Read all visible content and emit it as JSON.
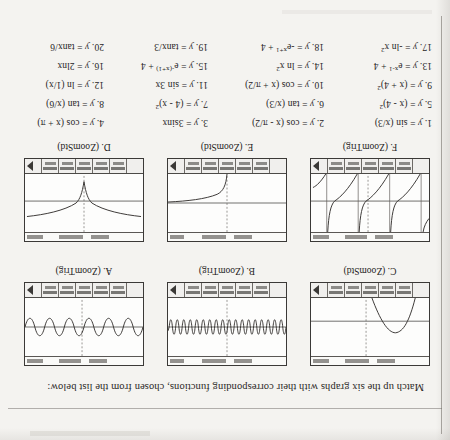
{
  "page": {
    "orientation": "upside-down",
    "title": "Match up the six graphs with their corresponding functions, chosen from the list below:"
  },
  "graphs": [
    {
      "id": "A",
      "label": "A. (ZoomTrig)",
      "window": "ZoomTrig",
      "shape": "sine-wave-moderate-frequency",
      "description": "Sine wave of moderate frequency, about 4 visible cycles, small amplitude, centered on the x-axis"
    },
    {
      "id": "B",
      "label": "B. (ZoomTrig)",
      "window": "ZoomTrig",
      "shape": "sine-wave-high-frequency",
      "description": "Sine wave of high frequency, about 18 visible cycles, small amplitude, centered on the x-axis"
    },
    {
      "id": "C",
      "label": "C. (ZoomStd)",
      "window": "ZoomStd",
      "shape": "downward-parabola",
      "description": "Downward-opening parabola with vertex above the x-axis in the left half of the screen"
    },
    {
      "id": "D",
      "label": "D. (ZoomStd)",
      "window": "ZoomStd",
      "shape": "negative-log-squared",
      "description": "Two symmetric branches descending into a sharp cusp at x = 0, flattening out to the left and right"
    },
    {
      "id": "E",
      "label": "E. (ZoomStd)",
      "window": "ZoomStd",
      "shape": "logarithmic-curve",
      "description": "Logarithmic curve rising steeply from the lower left then flattening toward the right"
    },
    {
      "id": "F",
      "label": "F. (ZoomTrig)",
      "window": "ZoomTrig",
      "shape": "tangent-branches",
      "description": "Repeating tangent branches with vertical asymptotes, three full branches visible"
    }
  ],
  "functions": [
    {
      "n": "1.",
      "lhs": "y",
      "rhs": "sin (x/3)"
    },
    {
      "n": "2.",
      "lhs": "y",
      "rhs": "cos (x - π/2)"
    },
    {
      "n": "3.",
      "lhs": "y",
      "rhs": "3sinx"
    },
    {
      "n": "4.",
      "lhs": "y",
      "rhs": "cos (x + π)"
    },
    {
      "n": "5.",
      "lhs": "y",
      "rhs": "(x - 4)",
      "sup": "2"
    },
    {
      "n": "6.",
      "lhs": "y",
      "rhs": "tan (x/3)"
    },
    {
      "n": "7.",
      "lhs": "y",
      "rhs": "(4 - x)",
      "sup": "2"
    },
    {
      "n": "8.",
      "lhs": "y",
      "rhs": "tan (x/6)"
    },
    {
      "n": "9.",
      "lhs": "y",
      "rhs": "(x + 4)",
      "sup": "2"
    },
    {
      "n": "10.",
      "lhs": "y",
      "rhs": "cos (x + π/2)"
    },
    {
      "n": "11.",
      "lhs": "y",
      "rhs": "sin 3x"
    },
    {
      "n": "12.",
      "lhs": "y",
      "rhs": "ln (1/x)"
    },
    {
      "n": "13.",
      "lhs": "y",
      "rhs": "e",
      "sup": "x-1",
      "tail": " + 4"
    },
    {
      "n": "14.",
      "lhs": "y",
      "rhs": "ln x",
      "sup": "2"
    },
    {
      "n": "15.",
      "lhs": "y",
      "rhs": "e",
      "sup": "-(x+1)",
      "tail": " + 4"
    },
    {
      "n": "16.",
      "lhs": "y",
      "rhs": "2lnx"
    },
    {
      "n": "17.",
      "lhs": "y",
      "rhs": "-ln x",
      "sup": "2"
    },
    {
      "n": "18.",
      "lhs": "y",
      "rhs": "-e",
      "sup": "x+1",
      "tail": " + 4"
    },
    {
      "n": "19.",
      "lhs": "y",
      "rhs": "tanx/3"
    },
    {
      "n": "20.",
      "lhs": "y",
      "rhs": "tanx/6"
    }
  ],
  "colors": {
    "paper": "#f4f3f0",
    "ink": "#26241f",
    "screen_border": "#3b3937",
    "curve": "#3a3734"
  }
}
